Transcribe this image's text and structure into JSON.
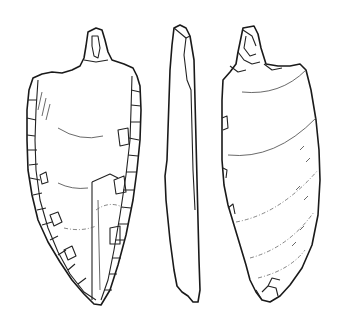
{
  "figure": {
    "views": [
      {
        "id": "dorsal",
        "label": "dorsal face with retouched edges"
      },
      {
        "id": "profile",
        "label": "lateral profile"
      },
      {
        "id": "ventral",
        "label": "ventral face with ripple lines"
      }
    ],
    "colors": {
      "background": "#ffffff",
      "ink": "#1a1a1a"
    }
  }
}
